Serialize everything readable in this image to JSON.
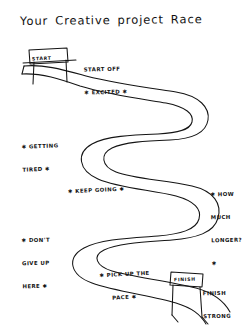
{
  "page": {
    "title_words": [
      "Your",
      "Creative",
      "project",
      "Race"
    ],
    "background_color": "#ffffff",
    "ink_color": "#111111"
  },
  "diagram": {
    "type": "hand-drawn-winding-road-journey"
  },
  "gates": [
    {
      "id": "start-gate",
      "label": "START",
      "position": "top-left",
      "x": 30,
      "y": 52
    },
    {
      "id": "finish-gate",
      "label": "FINISH",
      "position": "bottom-right",
      "x": 172,
      "y": 274
    }
  ],
  "annotations": [
    {
      "id": "start-off-excited",
      "lines": [
        "START OFF",
        "✱ EXCITED ✱"
      ],
      "x": 84,
      "y": 51
    },
    {
      "id": "getting-tired",
      "lines": [
        "✱ GETTING",
        "TIRED ✱"
      ],
      "x": 22,
      "y": 128
    },
    {
      "id": "keep-going",
      "lines": [
        "✱ KEEP GOING ✱"
      ],
      "x": 68,
      "y": 172
    },
    {
      "id": "how-much-longer",
      "lines": [
        "✱ HOW",
        "MUCH",
        "LONGER?",
        "✱"
      ],
      "x": 211,
      "y": 176
    },
    {
      "id": "dont-give-up-here",
      "lines": [
        "✱ DON'T",
        "GIVE UP",
        "HERE ✱"
      ],
      "x": 22,
      "y": 222
    },
    {
      "id": "pick-up-the-pace",
      "lines": [
        "✱ PICK UP THE",
        "     PACE ✱"
      ],
      "x": 100,
      "y": 256
    },
    {
      "id": "finish-strong",
      "lines": [
        "FINISH",
        "STRONG"
      ],
      "x": 203,
      "y": 275
    }
  ]
}
